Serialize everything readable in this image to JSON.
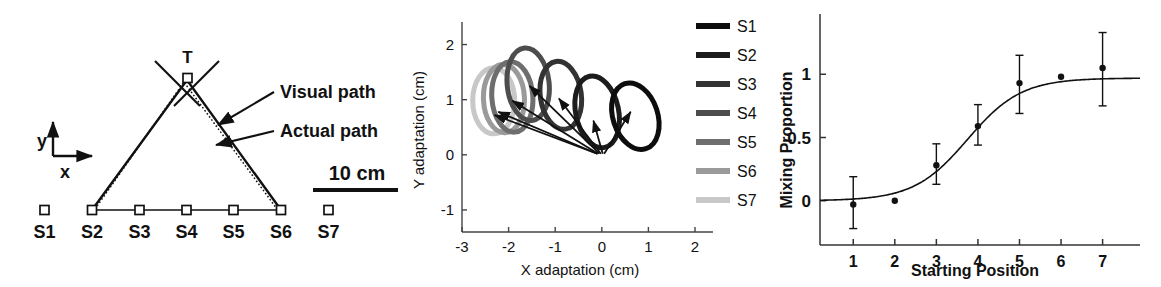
{
  "figure": {
    "panels": [
      "experimental-setup",
      "adaptation-ellipses",
      "mixing-proportion-sigmoid"
    ]
  },
  "panel_a": {
    "name": "experimental-setup-diagram",
    "target_label": "T",
    "axis_y_label": "y",
    "axis_x_label": "x",
    "annotation_visual": "Visual path",
    "annotation_actual": "Actual path",
    "scale_label": "10 cm",
    "start_labels": [
      "S1",
      "S2",
      "S3",
      "S4",
      "S5",
      "S6",
      "S7"
    ],
    "colors": {
      "line": "#111111",
      "marker_fill": "#ffffff",
      "text": "#000000"
    }
  },
  "chart_data": [
    {
      "type": "scatter",
      "name": "adaptation-ellipses",
      "title": "",
      "xlabel": "X adaptation (cm)",
      "ylabel": "Y adaptation (cm)",
      "xlim": [
        -3,
        2
      ],
      "ylim": [
        -1.4,
        2.3
      ],
      "xticks": [
        -3,
        -2,
        -1,
        0,
        1,
        2
      ],
      "yticks": [
        -1,
        0,
        1,
        2
      ],
      "grid": false,
      "legend_position": "right",
      "legend_title": "",
      "series": [
        {
          "name": "S1",
          "color": "#0d0d0d",
          "arrow_from": [
            0.05,
            0.02
          ],
          "arrow_to": [
            0.62,
            0.78
          ],
          "ellipse_center": [
            0.72,
            0.7
          ],
          "ellipse_rx": 0.48,
          "ellipse_ry": 0.62,
          "ellipse_rot": -18
        },
        {
          "name": "S2",
          "color": "#1c1c1c",
          "arrow_from": [
            0.02,
            0.02
          ],
          "arrow_to": [
            -0.18,
            0.62
          ],
          "ellipse_center": [
            -0.1,
            0.78
          ],
          "ellipse_rx": 0.46,
          "ellipse_ry": 0.66,
          "ellipse_rot": -12
        },
        {
          "name": "S3",
          "color": "#333333",
          "arrow_from": [
            -0.02,
            0.02
          ],
          "arrow_to": [
            -0.92,
            1.02
          ],
          "ellipse_center": [
            -0.88,
            1.08
          ],
          "ellipse_rx": 0.44,
          "ellipse_ry": 0.62,
          "ellipse_rot": -8
        },
        {
          "name": "S4",
          "color": "#4d4d4d",
          "arrow_from": [
            -0.05,
            0.02
          ],
          "arrow_to": [
            -1.55,
            1.25
          ],
          "ellipse_center": [
            -1.58,
            1.28
          ],
          "ellipse_rx": 0.45,
          "ellipse_ry": 0.66,
          "ellipse_rot": -6
        },
        {
          "name": "S5",
          "color": "#6e6e6e",
          "arrow_from": [
            -0.08,
            0.02
          ],
          "arrow_to": [
            -1.92,
            0.98
          ],
          "ellipse_center": [
            -1.92,
            1.05
          ],
          "ellipse_rx": 0.44,
          "ellipse_ry": 0.64,
          "ellipse_rot": -4
        },
        {
          "name": "S6",
          "color": "#9a9a9a",
          "arrow_from": [
            -0.1,
            0.02
          ],
          "arrow_to": [
            -2.22,
            0.78
          ],
          "ellipse_center": [
            -2.1,
            1.02
          ],
          "ellipse_rx": 0.44,
          "ellipse_ry": 0.62,
          "ellipse_rot": -2
        },
        {
          "name": "S7",
          "color": "#c8c8c8",
          "arrow_from": [
            -0.1,
            0.02
          ],
          "arrow_to": [
            -2.3,
            0.72
          ],
          "ellipse_center": [
            -2.32,
            0.98
          ],
          "ellipse_rx": 0.45,
          "ellipse_ry": 0.6,
          "ellipse_rot": 0
        }
      ]
    },
    {
      "type": "scatter",
      "name": "mixing-proportion-sigmoid",
      "title": "",
      "xlabel": "Starting Position",
      "ylabel": "Mixing Proportion",
      "xlim": [
        0.2,
        7.9
      ],
      "ylim": [
        -0.35,
        1.35
      ],
      "xticks": [
        1,
        2,
        3,
        4,
        5,
        6,
        7
      ],
      "yticks": [
        0,
        0.5,
        1
      ],
      "ytick_labels": [
        "0",
        "0.5",
        "1"
      ],
      "grid": false,
      "points": [
        {
          "x": 1,
          "y": -0.03,
          "err_low": 0.19,
          "err_high": 0.22
        },
        {
          "x": 2,
          "y": 0.0,
          "err_low": 0.0,
          "err_high": 0.0
        },
        {
          "x": 3,
          "y": 0.28,
          "err_low": 0.15,
          "err_high": 0.17
        },
        {
          "x": 4,
          "y": 0.59,
          "err_low": 0.15,
          "err_high": 0.17
        },
        {
          "x": 5,
          "y": 0.93,
          "err_low": 0.24,
          "err_high": 0.22
        },
        {
          "x": 6,
          "y": 0.98,
          "err_low": 0.0,
          "err_high": 0.0
        },
        {
          "x": 7,
          "y": 1.05,
          "err_low": 0.3,
          "err_high": 0.28
        }
      ],
      "fit_curve": {
        "name": "logistic-fit",
        "equation": "logistic",
        "midpoint": 3.75,
        "slope": 1.55,
        "amplitude": 0.97,
        "baseline": 0.0
      }
    }
  ]
}
